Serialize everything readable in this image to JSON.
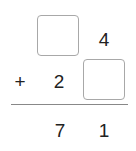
{
  "problem": {
    "row1": {
      "tens": "",
      "ones": "4"
    },
    "row2": {
      "operator": "+",
      "tens": "2",
      "ones": ""
    },
    "result": {
      "tens": "7",
      "ones": "1"
    }
  }
}
